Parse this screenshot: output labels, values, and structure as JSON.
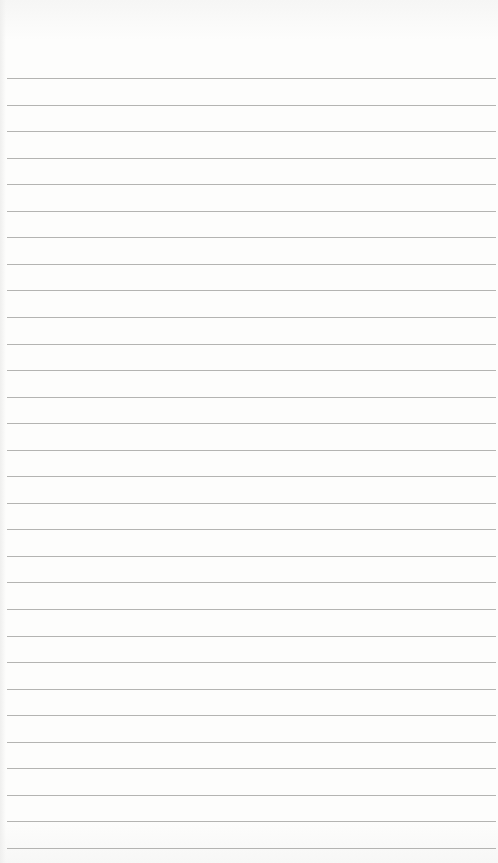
{
  "page": {
    "type": "lined-notepaper",
    "content_text": "",
    "line_count": 30,
    "first_line_y": 78,
    "line_spacing": 26.55,
    "line_x_start": 7,
    "line_x_end": 496
  },
  "colors": {
    "paper": "#fdfdfc",
    "rule": "#b4b4b2"
  }
}
